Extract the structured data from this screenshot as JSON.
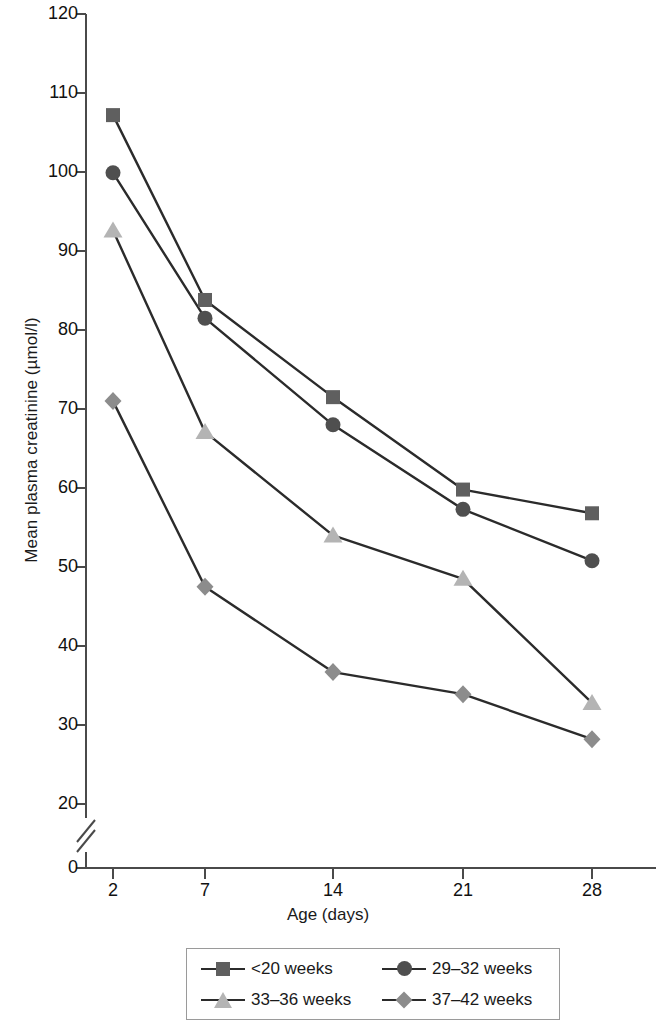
{
  "chart_data": {
    "type": "line",
    "title": "",
    "xlabel": "Age (days)",
    "ylabel": "Mean plasma creatinine (µmol/l)",
    "x": [
      2,
      7,
      14,
      21,
      28
    ],
    "xtick_labels": [
      "2",
      "7",
      "14",
      "21",
      "28"
    ],
    "ytick_labels": [
      "0",
      "20",
      "30",
      "40",
      "50",
      "60",
      "70",
      "80",
      "90",
      "100",
      "110",
      "120"
    ],
    "ylim": [
      20,
      120
    ],
    "y_axis_break": true,
    "y_axis_break_label": "0",
    "grid": false,
    "legend_position": "bottom",
    "series": [
      {
        "name": "<20 weeks",
        "marker": "square",
        "color": "#5f5f5f",
        "line_color": "#2b2b2b",
        "values": [
          107.2,
          83.8,
          71.5,
          59.8,
          56.8
        ]
      },
      {
        "name": "29–32 weeks",
        "marker": "circle",
        "color": "#4f4f4f",
        "line_color": "#2b2b2b",
        "values": [
          99.9,
          81.5,
          68.0,
          57.3,
          50.8
        ]
      },
      {
        "name": "33–36 weeks",
        "marker": "triangle",
        "color": "#b4b4b4",
        "line_color": "#2b2b2b",
        "values": [
          92.6,
          67.1,
          54.0,
          48.5,
          32.8
        ]
      },
      {
        "name": "37–42 weeks",
        "marker": "diamond",
        "color": "#8c8c8c",
        "line_color": "#2b2b2b",
        "values": [
          71.0,
          47.5,
          36.7,
          33.9,
          28.2
        ]
      }
    ]
  },
  "axis": {
    "y_label": "Mean plasma creatinine (µmol/l)",
    "x_label": "Age (days)",
    "y_ticks": [
      {
        "label": "120"
      },
      {
        "label": "110"
      },
      {
        "label": "100"
      },
      {
        "label": "90"
      },
      {
        "label": "80"
      },
      {
        "label": "70"
      },
      {
        "label": "60"
      },
      {
        "label": "50"
      },
      {
        "label": "40"
      },
      {
        "label": "30"
      },
      {
        "label": "20"
      },
      {
        "label": "0"
      }
    ],
    "x_ticks": [
      {
        "label": "2"
      },
      {
        "label": "7"
      },
      {
        "label": "14"
      },
      {
        "label": "21"
      },
      {
        "label": "28"
      }
    ]
  },
  "legend": {
    "items": [
      {
        "label": "<20 weeks",
        "marker": "square-marker",
        "color": "#5f5f5f"
      },
      {
        "label": "29–32 weeks",
        "marker": "circle-marker",
        "color": "#4f4f4f"
      },
      {
        "label": "33–36 weeks",
        "marker": "triangle-marker",
        "color": "#b4b4b4"
      },
      {
        "label": "37–42 weeks",
        "marker": "diamond-marker",
        "color": "#8c8c8c"
      }
    ]
  }
}
